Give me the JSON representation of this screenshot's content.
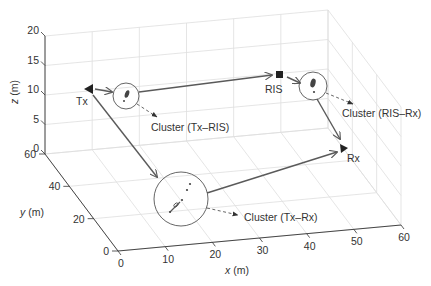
{
  "diagram": {
    "type": "3d-scatter-scene",
    "axes": {
      "x": {
        "label": "x (m)",
        "ticks": [
          "0",
          "10",
          "20",
          "30",
          "40",
          "50",
          "60"
        ],
        "range": [
          0,
          60
        ]
      },
      "y": {
        "label": "y (m)",
        "ticks": [
          "0",
          "20",
          "40",
          "60"
        ],
        "range": [
          0,
          60
        ]
      },
      "z": {
        "label": "z (m)",
        "ticks": [
          "0",
          "5",
          "10",
          "15",
          "20"
        ],
        "range": [
          0,
          20
        ]
      }
    },
    "nodes": [
      {
        "id": "tx",
        "label": "Tx",
        "marker": "triangle-left"
      },
      {
        "id": "ris",
        "label": "RIS",
        "marker": "square"
      },
      {
        "id": "rx",
        "label": "Rx",
        "marker": "triangle-right"
      }
    ],
    "clusters": [
      {
        "id": "tx-ris",
        "label": "Cluster (Tx–RIS)"
      },
      {
        "id": "ris-rx",
        "label": "Cluster (RIS–Rx)"
      },
      {
        "id": "tx-rx",
        "label": "Cluster (Tx–Rx)"
      }
    ],
    "links": [
      {
        "from": "tx",
        "to": "tx-ris"
      },
      {
        "from": "tx-ris",
        "to": "ris"
      },
      {
        "from": "ris",
        "to": "ris-rx"
      },
      {
        "from": "ris-rx",
        "to": "rx"
      },
      {
        "from": "tx",
        "to": "tx-rx"
      },
      {
        "from": "tx-rx",
        "to": "rx"
      }
    ],
    "colors": {
      "path": "#5a5a5a",
      "grid": "#dedede",
      "text": "#333333"
    }
  }
}
